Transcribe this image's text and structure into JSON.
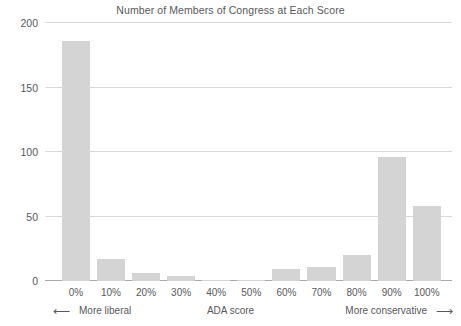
{
  "chart_data": {
    "type": "bar",
    "title": "Number of Members of Congress at Each Score",
    "xlabel": "ADA score",
    "ylabel": "",
    "categories": [
      "0%",
      "10%",
      "20%",
      "30%",
      "40%",
      "50%",
      "60%",
      "70%",
      "80%",
      "90%",
      "100%"
    ],
    "values": [
      186,
      17,
      6,
      4,
      1,
      1,
      9,
      11,
      20,
      96,
      58
    ],
    "ylim": [
      0,
      200
    ],
    "yticks": [
      0,
      50,
      100,
      150,
      200
    ],
    "ytick_labels": [
      "0",
      "50",
      "100",
      "150",
      "200"
    ],
    "grid": true,
    "legend": "none",
    "bar_color": "#d4d4d4",
    "grid_color": "#d9d9d9",
    "axis_color": "#a7a9ac",
    "text_color": "#58595b",
    "annotations": {
      "left_note": "More liberal",
      "left_arrow": "⟵",
      "right_note": "More conservative",
      "right_arrow": "⟶"
    }
  }
}
